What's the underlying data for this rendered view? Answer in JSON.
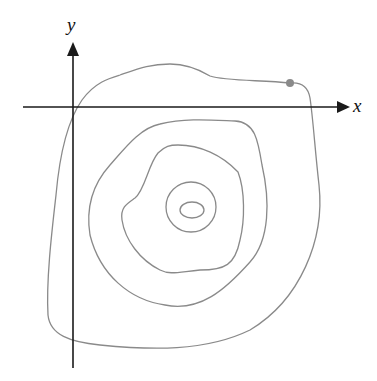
{
  "diagram": {
    "type": "contour-plot",
    "axes": {
      "x_label": "x",
      "y_label": "y"
    },
    "contour_count": 5,
    "marked_point": {
      "color": "#8a8a8a",
      "description": "point on outermost contour"
    },
    "colors": {
      "axis": "#1a1a1a",
      "contour": "#8a8a8a",
      "background": "#ffffff"
    }
  }
}
